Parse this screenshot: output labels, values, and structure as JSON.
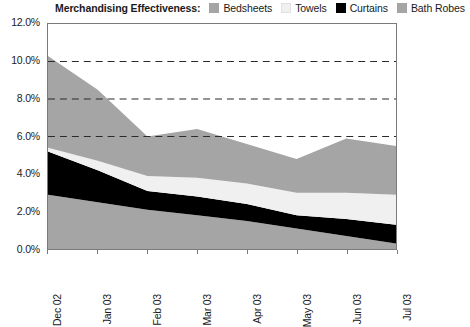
{
  "legend": {
    "title": "Merchandising Effectiveness:",
    "items": [
      {
        "label": "Bedsheets",
        "color": "#a5a5a5"
      },
      {
        "label": "Towels",
        "color": "#f0f0f0"
      },
      {
        "label": "Curtains",
        "color": "#000000"
      },
      {
        "label": "Bath Robes",
        "color": "#a5a5a5"
      }
    ]
  },
  "footnote": "",
  "chart_data": {
    "type": "area",
    "stacked": true,
    "title": "Merchandising Effectiveness:",
    "xlabel": "",
    "ylabel": "",
    "ylim": [
      0,
      12
    ],
    "ytick_values": [
      0,
      2,
      4,
      6,
      8,
      10,
      12
    ],
    "ytick_labels": [
      "0.0%",
      "2.0%",
      "4.0%",
      "6.0%",
      "8.0%",
      "10.0%",
      "12.0%"
    ],
    "grid": "horizontal-dashed",
    "gridlines": [
      6,
      8,
      10
    ],
    "legend_position": "top",
    "categories": [
      "Dec 02",
      "Jan 03",
      "Feb 03",
      "Mar 03",
      "Apr 03",
      "May 03",
      "Jun 03",
      "Jul 03"
    ],
    "series": [
      {
        "name": "Bath Robes",
        "color": "#a5a5a5",
        "values": [
          2.9,
          2.5,
          2.1,
          1.8,
          1.5,
          1.1,
          0.7,
          0.3
        ]
      },
      {
        "name": "Curtains",
        "color": "#000000",
        "values": [
          2.3,
          1.7,
          1.0,
          1.0,
          0.9,
          0.7,
          0.9,
          1.0
        ]
      },
      {
        "name": "Towels",
        "color": "#f0f0f0",
        "values": [
          0.2,
          0.5,
          0.8,
          1.0,
          1.1,
          1.2,
          1.4,
          1.6
        ]
      },
      {
        "name": "Bedsheets",
        "color": "#a5a5a5",
        "values": [
          4.9,
          3.8,
          2.1,
          2.6,
          2.1,
          1.8,
          2.9,
          2.6
        ]
      }
    ],
    "totals": [
      10.3,
      8.5,
      6.0,
      6.4,
      5.6,
      4.8,
      5.9,
      5.5
    ]
  }
}
